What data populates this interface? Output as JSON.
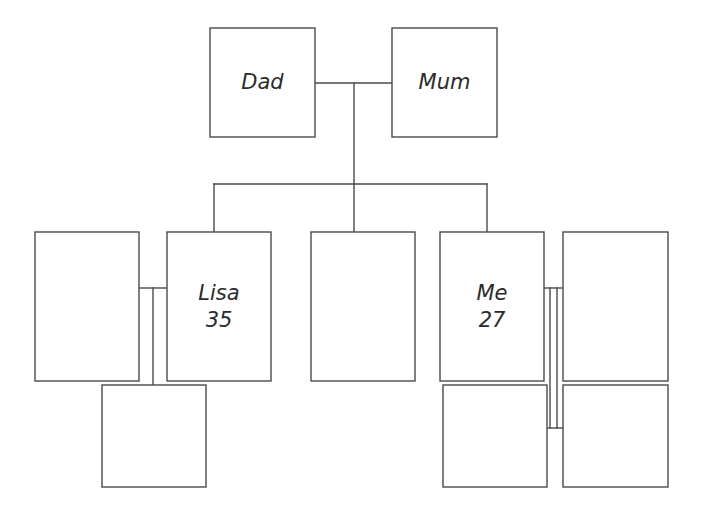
{
  "diagram": {
    "background_color": "#ffffff",
    "line_color": "#4a4a4a",
    "text_color": "#2b2b2b",
    "width": 703,
    "height": 510
  },
  "nodes": [
    {
      "id": "dad",
      "label": "Dad",
      "age": "",
      "generation": "grandparent",
      "x": 210,
      "y": 28,
      "w": 105,
      "h": 109
    },
    {
      "id": "mum",
      "label": "Mum",
      "age": "",
      "generation": "grandparent",
      "x": 392,
      "y": 28,
      "w": 105,
      "h": 109
    },
    {
      "id": "lisa-partner",
      "label": "",
      "age": "",
      "generation": "parent",
      "x": 35,
      "y": 232,
      "w": 104,
      "h": 149
    },
    {
      "id": "lisa",
      "label": "Lisa",
      "age": "35",
      "generation": "parent",
      "x": 167,
      "y": 232,
      "w": 104,
      "h": 149
    },
    {
      "id": "sibling-middle",
      "label": "",
      "age": "",
      "generation": "parent",
      "x": 311,
      "y": 232,
      "w": 104,
      "h": 149
    },
    {
      "id": "me",
      "label": "Me",
      "age": "27",
      "generation": "parent",
      "x": 440,
      "y": 232,
      "w": 104,
      "h": 149
    },
    {
      "id": "me-partner",
      "label": "",
      "age": "",
      "generation": "parent",
      "x": 563,
      "y": 232,
      "w": 105,
      "h": 149
    },
    {
      "id": "lisa-child",
      "label": "",
      "age": "",
      "generation": "child",
      "x": 102,
      "y": 385,
      "w": 104,
      "h": 102
    },
    {
      "id": "me-child-1",
      "label": "",
      "age": "",
      "generation": "child",
      "x": 443,
      "y": 385,
      "w": 104,
      "h": 102
    },
    {
      "id": "me-child-2",
      "label": "",
      "age": "",
      "generation": "child",
      "x": 563,
      "y": 385,
      "w": 105,
      "h": 102
    }
  ],
  "connectors": [
    {
      "id": "marriage-dad-mum",
      "kind": "marriage",
      "points": "315,83 392,83"
    },
    {
      "id": "descent-dad-mum",
      "kind": "descent",
      "points": "354,83 354,184"
    },
    {
      "id": "sibling-bar",
      "kind": "sibling-bar",
      "points": "214,184 487,184"
    },
    {
      "id": "drop-to-lisa",
      "kind": "descent",
      "points": "214,184 214,232"
    },
    {
      "id": "drop-to-sibling-middle",
      "kind": "descent",
      "points": "354,184 354,232"
    },
    {
      "id": "drop-to-me",
      "kind": "descent",
      "points": "487,184 487,232"
    },
    {
      "id": "marriage-lisa",
      "kind": "marriage",
      "points": "139,288 167,288"
    },
    {
      "id": "descent-lisa-child",
      "kind": "descent",
      "points": "153,288 153,385"
    },
    {
      "id": "marriage-me",
      "kind": "marriage",
      "points": "544,288 563,288"
    },
    {
      "id": "descent-me-left",
      "kind": "descent",
      "points": "550,288 550,428"
    },
    {
      "id": "descent-me-right",
      "kind": "descent",
      "points": "557,288 557,428"
    },
    {
      "id": "me-children-bar",
      "kind": "sibling-bar",
      "points": "544,428 563,428"
    }
  ]
}
